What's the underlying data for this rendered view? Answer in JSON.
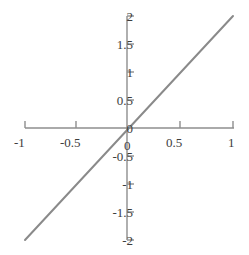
{
  "figure": {
    "background_color": "#ffffff",
    "axis_color": "#8e8e8e",
    "text_color": "#3d3d3d",
    "top_text_fragment": "· ·   ·   ·   ·     ·"
  },
  "chart_data": {
    "type": "line",
    "title": "",
    "subtitle": "",
    "xlabel": "",
    "ylabel": "",
    "xlim": [
      -1,
      1
    ],
    "ylim": [
      -2,
      2
    ],
    "grid": false,
    "legend": false,
    "legend_position": "none",
    "axes_style": "centered-spines",
    "line_color": "#8a8a8a",
    "line_width_px": 2,
    "relation": "y = 2x",
    "x": [
      -1,
      -0.5,
      0,
      0.5,
      1
    ],
    "y": [
      -2,
      -1,
      0,
      1,
      2
    ],
    "series": [
      {
        "name": "y = 2x",
        "color": "#8a8a8a",
        "x": [
          -1,
          -0.5,
          0,
          0.5,
          1
        ],
        "values": [
          -2,
          -1,
          0,
          1,
          2
        ]
      }
    ],
    "xticks": [
      -1,
      -0.5,
      0,
      0.5,
      1
    ],
    "xtick_labels": [
      "-1",
      "-0.5",
      "0",
      "0.5",
      "1"
    ],
    "yticks": [
      -2,
      -1.5,
      -1,
      -0.5,
      0,
      0.5,
      1,
      1.5,
      2
    ],
    "ytick_labels": [
      "-2",
      "-1.5",
      "-1",
      "-0.5",
      "0",
      "0.5",
      "1",
      "1.5",
      "2"
    ],
    "annotations": []
  },
  "labels": {
    "x": [
      {
        "text": "-1",
        "left": 14,
        "top": 136
      },
      {
        "text": "-0.5",
        "left": 60,
        "top": 136
      },
      {
        "text": "0",
        "left": 124,
        "top": 139
      },
      {
        "text": "0.5",
        "left": 166,
        "top": 136
      },
      {
        "text": "1",
        "left": 228,
        "top": 136
      }
    ],
    "y": [
      {
        "text": "2",
        "right": 133,
        "top": 10
      },
      {
        "text": "1.5",
        "right": 133,
        "top": 38
      },
      {
        "text": "1",
        "right": 133,
        "top": 66
      },
      {
        "text": "0.5",
        "right": 133,
        "top": 94
      },
      {
        "text": "0",
        "right": 133,
        "top": 122
      },
      {
        "text": "-0.5",
        "right": 133,
        "top": 150
      },
      {
        "text": "-1",
        "right": 133,
        "top": 178
      },
      {
        "text": "-1.5",
        "right": 133,
        "top": 206
      },
      {
        "text": "-2",
        "right": 133,
        "top": 234
      }
    ]
  }
}
